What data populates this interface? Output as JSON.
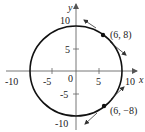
{
  "diagram": {
    "type": "circle-with-tangent-lines",
    "equation_implied": "x^2 + y^2 = 100",
    "center": [
      0,
      0
    ],
    "radius": 10,
    "axes": {
      "x_label": "x",
      "y_label": "y",
      "x_ticks": [
        "-10",
        "-5",
        "0",
        "5",
        "10"
      ],
      "y_ticks": [
        "10",
        "5",
        "-5",
        "-10"
      ],
      "origin_label": "0"
    },
    "points": [
      {
        "label": "(6, 8)",
        "x": 6,
        "y": 8,
        "tangent_slope": -0.75
      },
      {
        "label": "(6, −8)",
        "x": 6,
        "y": -8,
        "tangent_slope": 0.75
      }
    ]
  },
  "colors": {
    "curve": "#111111",
    "axis": "#555555",
    "tangent": "#333333",
    "text": "#222222"
  }
}
